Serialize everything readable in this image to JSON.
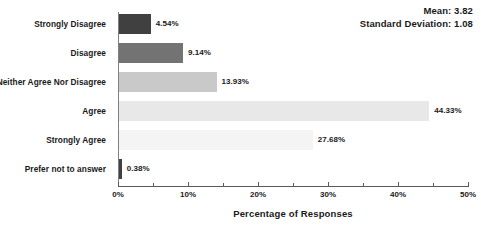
{
  "chart_data": {
    "type": "bar",
    "orientation": "horizontal",
    "title": "",
    "xlabel": "Percentage of Responses",
    "ylabel": "",
    "xlim": [
      0,
      50
    ],
    "xtick_labels": [
      "0%",
      "10%",
      "20%",
      "30%",
      "40%",
      "50%"
    ],
    "xtick_values": [
      0,
      10,
      20,
      30,
      40,
      50
    ],
    "minor_tick_interval": 5,
    "grid": false,
    "legend": "none",
    "categories": [
      "Strongly Disagree",
      "Disagree",
      "Neither Agree Nor Disagree",
      "Agree",
      "Strongly Agree",
      "Prefer not to answer"
    ],
    "values": [
      4.54,
      9.14,
      13.93,
      44.33,
      27.68,
      0.38
    ],
    "value_labels": [
      "4.54%",
      "9.14%",
      "13.93%",
      "44.33%",
      "27.68%",
      "0.38%"
    ],
    "bar_colors": [
      "#404040",
      "#737373",
      "#c9c9c9",
      "#e8e8e8",
      "#f4f4f4",
      "#404040"
    ],
    "annotations": {
      "mean_label": "Mean: 3.82",
      "std_label": "Standard Deviation: 1.08"
    }
  },
  "axis": {
    "line_color": "#595959"
  }
}
